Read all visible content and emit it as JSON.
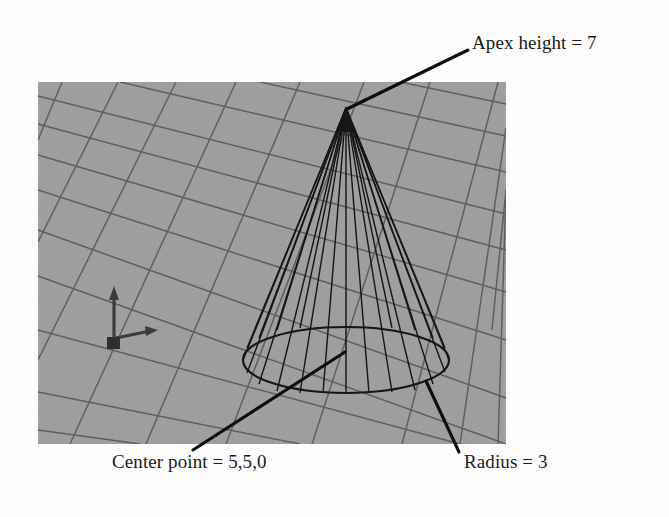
{
  "figure": {
    "kind": "3d-wireframe-cone-diagram",
    "background_color": "#ffffff",
    "viewport": {
      "fill_color": "#9d9d9d",
      "x": 38,
      "y": 82,
      "width": 468,
      "height": 362,
      "grid_color": "#5a5a5a"
    },
    "annotations": [
      {
        "id": "apex",
        "text": "Apex height = 7",
        "leader_from_x": 347,
        "leader_from_y": 109,
        "leader_to_x": 468,
        "leader_to_y": 50
      },
      {
        "id": "center",
        "text": "Center point = 5,5,0",
        "leader_from_x": 345,
        "leader_from_y": 352,
        "leader_to_x": 193,
        "leader_to_y": 450
      },
      {
        "id": "radius",
        "text": "Radius = 3",
        "leader_from_x": 426,
        "leader_from_y": 381,
        "leader_to_x": 459,
        "leader_to_y": 452
      }
    ],
    "cone": {
      "apex_x": 346,
      "apex_y": 108,
      "base_center_x": 346,
      "base_center_y": 360,
      "base_rx": 103,
      "base_ry": 33,
      "wire_color": "#141414",
      "generator_count": 16
    },
    "axis_gizmo": {
      "origin_x": 114,
      "origin_y": 341,
      "z_axis_label": "z-axis-arrow",
      "x_axis_label": "x-axis-arrow",
      "color": "#3b3b3b"
    }
  },
  "labels": {
    "apex_height": "Apex height = 7",
    "center_point": "Center point = 5,5,0",
    "radius": "Radius = 3"
  }
}
